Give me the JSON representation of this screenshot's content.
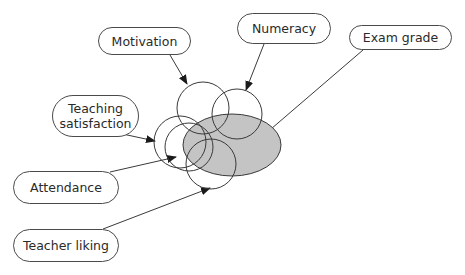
{
  "colors": {
    "stroke": "#3a3a3a",
    "ellipse_fill": "#c4c4c4",
    "text": "#2a2a2a",
    "background": "#ffffff"
  },
  "target": {
    "label": "Exam grade",
    "shape": "ellipse",
    "cx": 232,
    "cy": 145,
    "rx": 49,
    "ry": 31
  },
  "predictors": [
    {
      "id": "motivation",
      "label": "Motivation",
      "cx": 203,
      "cy": 108,
      "r": 26
    },
    {
      "id": "numeracy",
      "label": "Numeracy",
      "cx": 237,
      "cy": 114,
      "r": 25
    },
    {
      "id": "teaching-satisfaction",
      "label": "Teaching satisfaction",
      "line1": "Teaching",
      "line2": "satisfaction",
      "cx": 180,
      "cy": 142,
      "r": 26
    },
    {
      "id": "attendance",
      "label": "Attendance",
      "cx": 189,
      "cy": 147,
      "r": 24
    },
    {
      "id": "teacher-liking",
      "label": "Teacher liking",
      "cx": 211,
      "cy": 164,
      "r": 25
    }
  ],
  "labels": {
    "motivation": {
      "text": "Motivation",
      "x": 98,
      "y": 27,
      "w": 93,
      "h": 28
    },
    "numeracy": {
      "text": "Numeracy",
      "x": 237,
      "y": 13,
      "w": 94,
      "h": 31
    },
    "exam_grade": {
      "text": "Exam grade",
      "x": 349,
      "y": 25,
      "w": 103,
      "h": 25
    },
    "teaching_satisfaction": {
      "line1": "Teaching",
      "line2": "satisfaction",
      "x": 52,
      "y": 95,
      "w": 87,
      "h": 42
    },
    "attendance": {
      "text": "Attendance",
      "x": 13,
      "y": 171,
      "w": 106,
      "h": 33
    },
    "teacher_liking": {
      "text": "Teacher liking",
      "x": 13,
      "y": 229,
      "w": 106,
      "h": 33
    }
  },
  "arrows": [
    {
      "from": "motivation",
      "x1": 170,
      "y1": 55,
      "x2": 187,
      "y2": 84
    },
    {
      "from": "numeracy",
      "x1": 264,
      "y1": 44,
      "x2": 246,
      "y2": 90
    },
    {
      "from": "exam_grade",
      "x1": 363,
      "y1": 50,
      "x2": 264,
      "y2": 135
    },
    {
      "from": "teaching_satisfaction",
      "x1": 118,
      "y1": 133,
      "x2": 155,
      "y2": 141
    },
    {
      "from": "attendance",
      "x1": 110,
      "y1": 172,
      "x2": 176,
      "y2": 157
    },
    {
      "from": "teacher_liking",
      "x1": 103,
      "y1": 229,
      "x2": 210,
      "y2": 188
    }
  ]
}
